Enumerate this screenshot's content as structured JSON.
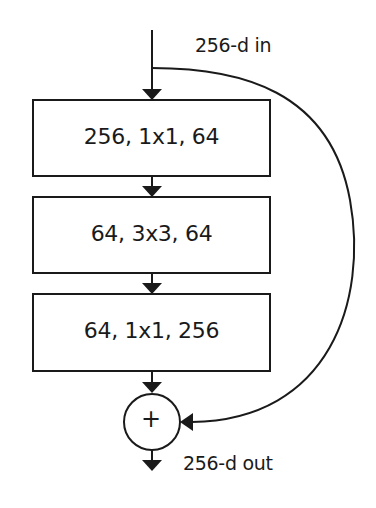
{
  "diagram": {
    "type": "residual bottleneck block",
    "input_label": "256-d in",
    "output_label": "256-d out",
    "layers": [
      {
        "label": "256, 1x1, 64"
      },
      {
        "label": "64, 3x3, 64"
      },
      {
        "label": "64, 1x1, 256"
      }
    ],
    "merge_op": "+",
    "colors": {
      "stroke": "#1a1a1a",
      "background": "#ffffff"
    }
  }
}
